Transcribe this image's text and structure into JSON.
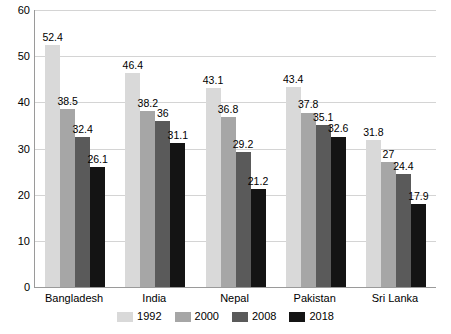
{
  "chart_data": {
    "type": "bar",
    "title": "",
    "xlabel": "",
    "ylabel": "",
    "ylim": [
      0,
      60
    ],
    "yticks": [
      0,
      10,
      20,
      30,
      40,
      50,
      60
    ],
    "grid": true,
    "legend_position": "bottom",
    "categories": [
      "Bangladesh",
      "India",
      "Nepal",
      "Pakistan",
      "Sri Lanka"
    ],
    "series": [
      {
        "name": "1992",
        "color": "#d9d9d9",
        "values": [
          52.4,
          46.4,
          43.1,
          43.4,
          31.8
        ],
        "labels": [
          "52.4",
          "46.4",
          "43.1",
          "43.4",
          "31.8"
        ]
      },
      {
        "name": "2000",
        "color": "#a6a6a6",
        "values": [
          38.5,
          38.2,
          36.8,
          37.8,
          27
        ],
        "labels": [
          "38.5",
          "38.2",
          "36.8",
          "37.8",
          "27"
        ]
      },
      {
        "name": "2008",
        "color": "#5a5a5a",
        "values": [
          32.4,
          36,
          29.2,
          35.1,
          24.4
        ],
        "labels": [
          "32.4",
          "36",
          "29.2",
          "35.1",
          "24.4"
        ]
      },
      {
        "name": "2018",
        "color": "#141414",
        "values": [
          26.1,
          31.1,
          21.2,
          32.6,
          17.9
        ],
        "labels": [
          "26.1",
          "31.1",
          "21.2",
          "32.6",
          "17.9"
        ]
      }
    ]
  }
}
